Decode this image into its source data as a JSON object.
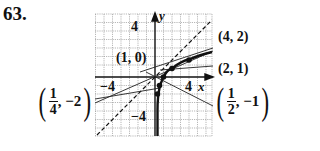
{
  "problem_number": "63.",
  "graph": {
    "axes": {
      "x_label": "x",
      "y_label": "y",
      "x_tick_pos": "4",
      "x_tick_neg": "−4",
      "y_tick_pos": "4",
      "y_tick_neg": "−4"
    },
    "range": {
      "x": [
        -6,
        6
      ],
      "y": [
        -6,
        6
      ]
    },
    "curves": [
      {
        "name": "y = log2(x)",
        "style": "solid-bold",
        "points": [
          [
            0.25,
            -2
          ],
          [
            0.5,
            -1
          ],
          [
            1,
            0
          ],
          [
            2,
            1
          ],
          [
            4,
            2
          ]
        ]
      },
      {
        "name": "y = x",
        "style": "dashed"
      },
      {
        "name": "tangent-like line through (1/4,-2)",
        "style": "thin"
      },
      {
        "name": "line through (1/2,-1)",
        "style": "thin"
      },
      {
        "name": "line through (1,0)",
        "style": "thin"
      },
      {
        "name": "line through (2,1)",
        "style": "thin"
      },
      {
        "name": "line through (4,2)",
        "style": "thin"
      }
    ]
  },
  "labels": {
    "p1": "(1, 0)",
    "p2": "(4, 2)",
    "p3": "(2, 1)",
    "p4": {
      "num": "1",
      "den": "4",
      "tail": ", −2"
    },
    "p5": {
      "num": "1",
      "den": "2",
      "tail": ", −1"
    }
  },
  "colors": {
    "ink": "#111111",
    "grid": "#9a9a9a",
    "background": "#ffffff"
  }
}
